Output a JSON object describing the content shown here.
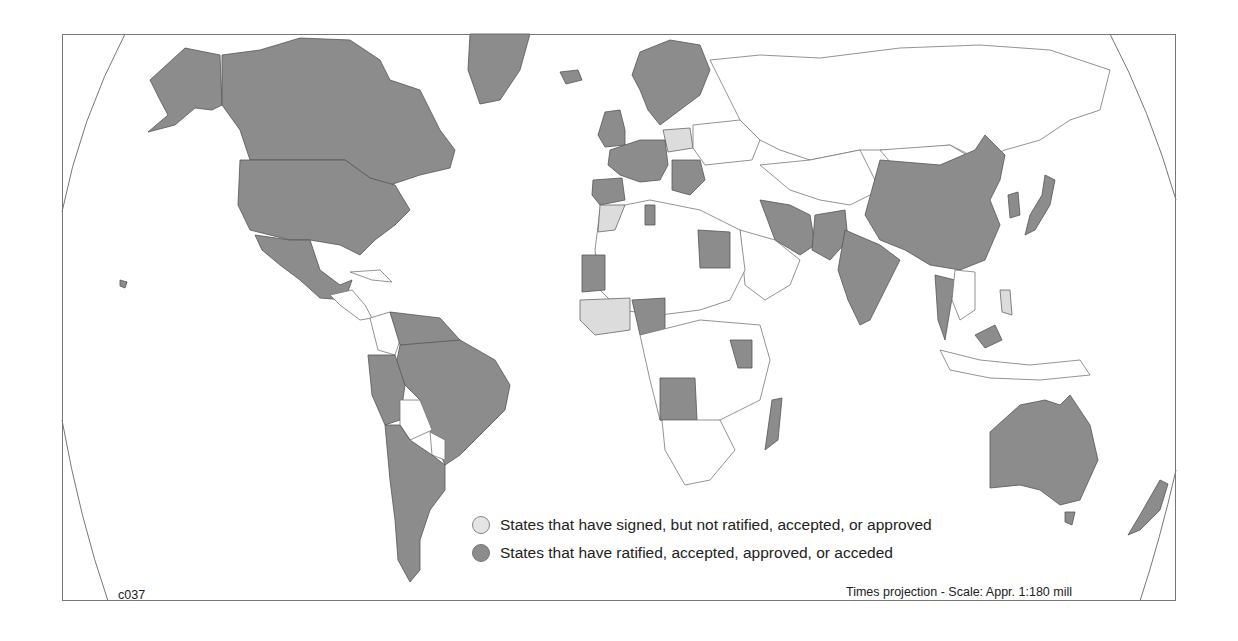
{
  "map": {
    "code": "c037",
    "projection_note": "Times projection - Scale: Appr. 1:180 mill",
    "colors": {
      "ratified": "#8c8c8c",
      "signed": "#dcdcdc",
      "none": "#ffffff",
      "border": "#666666"
    }
  },
  "legend": {
    "items": [
      {
        "key": "signed",
        "label": "States that have signed, but not ratified, accepted, or approved"
      },
      {
        "key": "ratified",
        "label": "States that have ratified, accepted, approved, or acceded"
      }
    ]
  }
}
